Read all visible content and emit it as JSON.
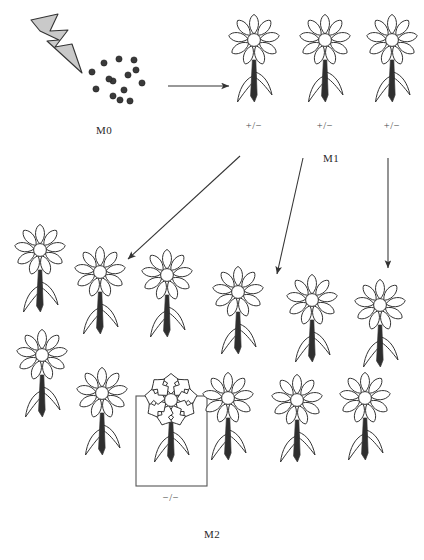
{
  "figure": {
    "type": "diagram",
    "background": "#ffffff",
    "ink": "#333333",
    "bolt_fill": "#c9c9c9",
    "dot_fill": "#3a3a3a",
    "box_stroke": "#555555"
  },
  "generations": [
    {
      "id": "M0",
      "label": "M0",
      "label_x": 104,
      "label_y": 124
    },
    {
      "id": "M1",
      "label": "M1",
      "label_x": 331,
      "label_y": 152
    },
    {
      "id": "M2",
      "label": "M2",
      "label_x": 212,
      "label_y": 528
    }
  ],
  "mutagen": {
    "name": "lightning-bolt-icon",
    "description": "mutagen treatment",
    "points": "31,20 58,14 50,31 68,30 55,47 72,44 82,73 47,41 59,40 40,31"
  },
  "seeds": {
    "name": "seed-cluster",
    "count": 14,
    "radius": 3.1,
    "points": [
      [
        92,
        72
      ],
      [
        104,
        63
      ],
      [
        113,
        81
      ],
      [
        119,
        59
      ],
      [
        128,
        75
      ],
      [
        96,
        89
      ],
      [
        124,
        90
      ],
      [
        136,
        70
      ],
      [
        142,
        83
      ],
      [
        113,
        96
      ],
      [
        120,
        100
      ],
      [
        130,
        101
      ],
      [
        109,
        79
      ],
      [
        134,
        60
      ]
    ]
  },
  "arrows": [
    {
      "name": "arrow-m0-to-m1",
      "x1": 168,
      "y1": 86,
      "x2": 229,
      "y2": 86
    },
    {
      "name": "arrow-m1-to-m2-left",
      "x1": 240,
      "y1": 156,
      "x2": 128,
      "y2": 259
    },
    {
      "name": "arrow-m1-to-m2-middle",
      "x1": 303,
      "y1": 158,
      "x2": 277,
      "y2": 274
    },
    {
      "name": "arrow-m1-to-m2-right",
      "x1": 388,
      "y1": 158,
      "x2": 388,
      "y2": 268
    }
  ],
  "m1_plants": [
    {
      "name": "m1-plant-1",
      "x": 254,
      "y": 40,
      "genotype": "+/−",
      "glabel_x": 254,
      "glabel_y": 120,
      "mutant": false
    },
    {
      "name": "m1-plant-2",
      "x": 325,
      "y": 40,
      "genotype": "+/−",
      "glabel_x": 325,
      "glabel_y": 120,
      "mutant": false
    },
    {
      "name": "m1-plant-3",
      "x": 392,
      "y": 40,
      "genotype": "+/−",
      "glabel_x": 392,
      "glabel_y": 120,
      "mutant": false
    }
  ],
  "m2_plants": [
    {
      "name": "m2-plant-1",
      "x": 40,
      "y": 250,
      "mutant": false
    },
    {
      "name": "m2-plant-2",
      "x": 100,
      "y": 272,
      "mutant": false
    },
    {
      "name": "m2-plant-3",
      "x": 167,
      "y": 275,
      "mutant": false
    },
    {
      "name": "m2-plant-4",
      "x": 238,
      "y": 292,
      "mutant": false
    },
    {
      "name": "m2-plant-5",
      "x": 312,
      "y": 300,
      "mutant": false
    },
    {
      "name": "m2-plant-6",
      "x": 380,
      "y": 305,
      "mutant": false
    },
    {
      "name": "m2-plant-7",
      "x": 42,
      "y": 355,
      "mutant": false
    },
    {
      "name": "m2-plant-8",
      "x": 102,
      "y": 393,
      "mutant": false
    },
    {
      "name": "m2-plant-9",
      "x": 171,
      "y": 400,
      "mutant": true,
      "genotype": "−/−",
      "glabel_x": 171,
      "glabel_y": 492,
      "box": {
        "x": 136,
        "y": 396,
        "w": 71,
        "h": 90
      }
    },
    {
      "name": "m2-plant-10",
      "x": 228,
      "y": 398,
      "mutant": false
    },
    {
      "name": "m2-plant-11",
      "x": 297,
      "y": 400,
      "mutant": false
    },
    {
      "name": "m2-plant-12",
      "x": 365,
      "y": 398,
      "mutant": false
    }
  ]
}
